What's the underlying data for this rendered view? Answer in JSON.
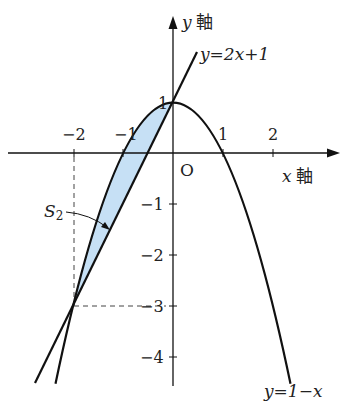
{
  "figure": {
    "y_axis_label": "y 軸",
    "x_axis_label": "x 軸",
    "origin_label": "O",
    "line_label": "y=2x+1",
    "parabola_label": "y=1−x",
    "region_label": "S2",
    "x_ticks": [
      "−2",
      "−1",
      "1",
      "2"
    ],
    "y_ticks": [
      "1",
      "−1",
      "−2",
      "−3",
      "−4"
    ],
    "colors": {
      "region_fill": "#c6e0f5",
      "stroke": "#111111"
    }
  },
  "chart_data": {
    "type": "line",
    "title": "",
    "xlabel": "x 軸",
    "ylabel": "y 軸",
    "series": [
      {
        "name": "y=2x+1",
        "kind": "line",
        "x": [
          -2.76,
          0.48
        ],
        "y": [
          -4.52,
          1.96
        ]
      },
      {
        "name": "y=1−x²",
        "kind": "parabola",
        "x_range": [
          -2.35,
          2.35
        ]
      }
    ],
    "shaded_region": {
      "name": "S2",
      "between": [
        "y=1−x²",
        "y=2x+1"
      ],
      "x_range": [
        -2,
        0
      ]
    },
    "intersections": [
      [
        -2,
        -3
      ],
      [
        0,
        1
      ]
    ],
    "x_ticks": [
      -2,
      -1,
      1,
      2
    ],
    "y_ticks": [
      1,
      -1,
      -2,
      -3,
      -4
    ],
    "grid": false
  }
}
